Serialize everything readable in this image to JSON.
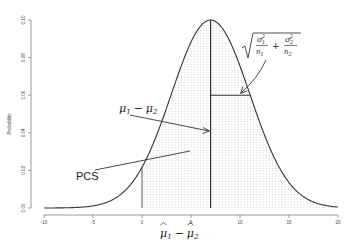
{
  "chart_data": {
    "type": "line",
    "title": "",
    "xlabel": "μ̂1 − μ̂2",
    "ylabel": "Probability",
    "xlim": [
      -10,
      20
    ],
    "ylim": [
      0,
      0.1
    ],
    "x_ticks": [
      -10,
      -5,
      0,
      5,
      10,
      15,
      20
    ],
    "x_tick_labels": [
      "-10",
      "-5",
      "0",
      "5",
      "10",
      "15",
      "20"
    ],
    "y_ticks": [
      0.0,
      0.02,
      0.04,
      0.06,
      0.08,
      0.1
    ],
    "y_tick_labels": [
      "0.00",
      "0.02",
      "0.04",
      "0.06",
      "0.08",
      "0.10"
    ],
    "grid": false,
    "legend": null,
    "series": [
      {
        "name": "normal density",
        "distribution": "normal",
        "mean": 7,
        "sd": 4,
        "peak": 0.1
      }
    ],
    "shaded_region": {
      "from": 0,
      "to": 20,
      "style": "dotted"
    },
    "reference_lines": [
      {
        "type": "vertical",
        "x": 0
      },
      {
        "type": "vertical",
        "x": 7,
        "label": "mean"
      },
      {
        "type": "horizontal",
        "from_x": 7,
        "to_x": 11,
        "y": 0.06,
        "label": "sd"
      }
    ],
    "annotations": [
      {
        "text": "μ1 − μ2",
        "points_to": [
          7,
          0.04
        ]
      },
      {
        "text": "√(σ1²/n1 + σ2²/n2)",
        "points_to": [
          10.5,
          0.06
        ]
      },
      {
        "text": "PCS",
        "points_to": [
          5,
          0.031
        ]
      }
    ]
  },
  "labels": {
    "ylabel": "Probability",
    "pcs": "PCS",
    "mu_diff_a": "μ",
    "mu_diff_sub1": "1",
    "mu_diff_minus": "−",
    "mu_diff_b": "μ",
    "mu_diff_sub2": "2",
    "sigma": "σ",
    "n": "n",
    "plus": "+",
    "sub1": "1",
    "sub2": "2",
    "sup2": "2",
    "xlabel_mu": "μ",
    "xlabel_minus": "−"
  }
}
